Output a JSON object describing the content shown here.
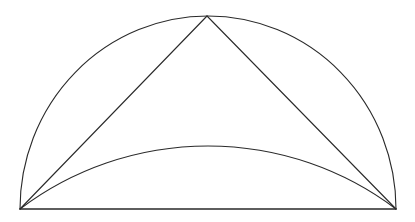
{
  "diagram": {
    "title": "",
    "colors": {
      "background": "#ffffff",
      "stroke": "#2a2a2a"
    },
    "points": {
      "left": {
        "x": 20,
        "y": 209
      },
      "right": {
        "x": 396,
        "y": 209
      },
      "apex": {
        "x": 207,
        "y": 16
      },
      "inner_arc_peak": {
        "x": 207,
        "y": 146
      }
    },
    "shapes": [
      {
        "id": "semicircle-arc",
        "type": "arc",
        "from": "left",
        "to": "right",
        "through": "apex"
      },
      {
        "id": "diameter",
        "type": "line",
        "from": "left",
        "to": "right"
      },
      {
        "id": "left-chord",
        "type": "line",
        "from": "left",
        "to": "apex"
      },
      {
        "id": "right-chord",
        "type": "line",
        "from": "apex",
        "to": "right"
      },
      {
        "id": "inner-arc",
        "type": "arc",
        "from": "left",
        "to": "right",
        "through": "inner_arc_peak"
      }
    ],
    "labels": []
  }
}
